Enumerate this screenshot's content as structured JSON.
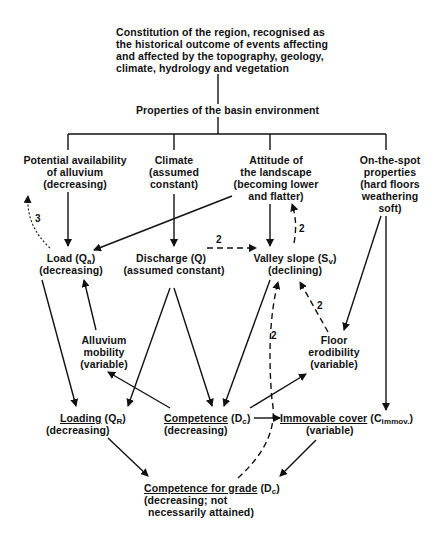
{
  "diagram": {
    "root": {
      "lines": [
        "Constitution of the region, recognised as",
        "the historical outcome of events affecting",
        "and affected by the topography, geology,",
        "climate, hydrology and vegetation"
      ]
    },
    "basin": {
      "label": "Properties of the basin environment"
    },
    "alluvium_availability": {
      "lines": [
        "Potential availability",
        "of alluvium",
        "(decreasing)"
      ]
    },
    "climate": {
      "lines": [
        "Climate",
        "(assumed",
        "constant)"
      ]
    },
    "landscape": {
      "lines": [
        "Attitude of",
        "the landscape",
        "(becoming lower",
        "and flatter)"
      ]
    },
    "on_the_spot": {
      "lines": [
        "On-the-spot",
        "properties",
        "(hard floors",
        "weathering",
        "soft)"
      ]
    },
    "load": {
      "main": "Load (Q",
      "sub": "a",
      "close": ")",
      "line2": "(decreasing)"
    },
    "discharge": {
      "line1": "Discharge (Q)",
      "line2": "(assumed constant)"
    },
    "valley_slope": {
      "main": "Valley slope (S",
      "sub": "v",
      "close": ")",
      "line2": "(declining)"
    },
    "alluvium_mobility": {
      "lines": [
        "Alluvium",
        "mobility",
        "(variable)"
      ]
    },
    "floor_erodibility": {
      "lines": [
        "Floor",
        "erodibility",
        "(variable)"
      ]
    },
    "loading": {
      "main": "Loading",
      "paren": " (Q",
      "sub": "R",
      "close": ")",
      "line2": "(decreasing)"
    },
    "competence": {
      "main": "Competence",
      "paren": " (D",
      "sub": "c",
      "close": ")",
      "line2": "(decreasing)"
    },
    "immovable_cover": {
      "main": "Immovable cover",
      "paren": " (C",
      "sub": "immov.",
      "close": ")",
      "line2": "(variable)"
    },
    "competence_grade": {
      "main": "Competence for grade",
      "paren": " (D",
      "sub": "c",
      "close": ")",
      "line2": "(decreasing; not",
      "line3": "necessarily attained)"
    },
    "edge_labels": {
      "load_to_alluvium": "3",
      "discharge_to_slope": "2",
      "slope_to_landscape": "2",
      "floor_to_slope": "2",
      "grade_to_slope": "2"
    }
  }
}
